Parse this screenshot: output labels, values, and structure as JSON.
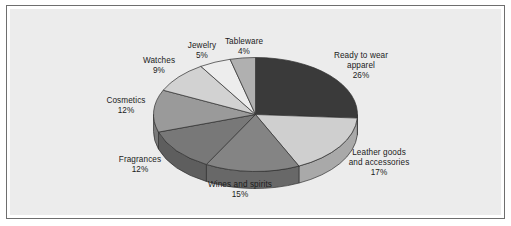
{
  "figure": {
    "background_color": "#ececec",
    "frame_color": "#6e6e6e",
    "page_background": "#ffffff"
  },
  "chart_data": {
    "type": "pie",
    "title": "",
    "subtitle": "",
    "xlabel": "",
    "ylabel": "",
    "grid": false,
    "legend_position": "none",
    "style": "3d-pie",
    "units": "percent",
    "labels_show_percent": true,
    "categories": [
      "Ready to wear apparel",
      "Leather goods and accessories",
      "Wines and spirits",
      "Fragrances",
      "Cosmetics",
      "Watches",
      "Jewelry",
      "Tableware"
    ],
    "values": [
      26,
      17,
      15,
      12,
      12,
      9,
      5,
      4
    ],
    "slices": [
      {
        "name": "Ready to wear apparel",
        "label_line1": "Ready to wear",
        "label_line2": "apparel",
        "value": 26,
        "percent_text": "26%",
        "color": "#3a3a3a",
        "side_color": "#2a2a2a"
      },
      {
        "name": "Leather goods and accessories",
        "label_line1": "Leather goods",
        "label_line2": "and accessories",
        "value": 17,
        "percent_text": "17%",
        "color": "#cfcfcf",
        "side_color": "#a9a9a9"
      },
      {
        "name": "Wines and spirits",
        "label_line1": "Wines and spirits",
        "label_line2": "",
        "value": 15,
        "percent_text": "15%",
        "color": "#848484",
        "side_color": "#686868"
      },
      {
        "name": "Fragrances",
        "label_line1": "Fragrances",
        "label_line2": "",
        "value": 12,
        "percent_text": "12%",
        "color": "#787878",
        "side_color": "#5e5e5e"
      },
      {
        "name": "Cosmetics",
        "label_line1": "Cosmetics",
        "label_line2": "",
        "value": 12,
        "percent_text": "12%",
        "color": "#9a9a9a",
        "side_color": "#7a7a7a"
      },
      {
        "name": "Watches",
        "label_line1": "Watches",
        "label_line2": "",
        "value": 9,
        "percent_text": "9%",
        "color": "#d2d2d2",
        "side_color": "#ababab"
      },
      {
        "name": "Jewelry",
        "label_line1": "Jewelry",
        "label_line2": "",
        "value": 5,
        "percent_text": "5%",
        "color": "#ededed",
        "side_color": "#c2c2c2"
      },
      {
        "name": "Tableware",
        "label_line1": "Tableware",
        "label_line2": "",
        "value": 4,
        "percent_text": "4%",
        "color": "#b0b0b0",
        "side_color": "#8d8d8d"
      }
    ]
  }
}
